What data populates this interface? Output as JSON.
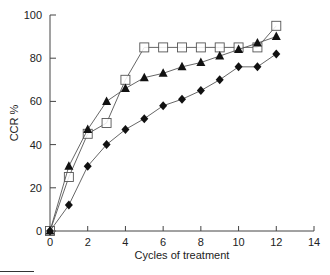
{
  "chart_data": {
    "type": "line",
    "title": "",
    "xlabel": "Cycles  of  treatment",
    "ylabel": "CCR %",
    "xlim": [
      0,
      14
    ],
    "ylim": [
      0,
      100
    ],
    "xticks": [
      0,
      2,
      4,
      6,
      8,
      10,
      12,
      14
    ],
    "yticks": [
      0,
      20,
      40,
      60,
      80,
      100
    ],
    "grid": false,
    "legend": "none",
    "x": [
      0,
      1,
      2,
      3,
      4,
      5,
      6,
      7,
      8,
      9,
      10,
      11,
      12
    ],
    "series": [
      {
        "name": "open-square",
        "marker": "square-open",
        "values": [
          0,
          25,
          45,
          50,
          70,
          85,
          85,
          85,
          85,
          85,
          85,
          85,
          95
        ]
      },
      {
        "name": "filled-triangle",
        "marker": "triangle-filled",
        "values": [
          0,
          30,
          47,
          60,
          66,
          71,
          73,
          76,
          78,
          81,
          84,
          87,
          90
        ]
      },
      {
        "name": "filled-diamond",
        "marker": "diamond-filled",
        "values": [
          0,
          12,
          30,
          40,
          47,
          52,
          58,
          61,
          65,
          70,
          76,
          76,
          82
        ]
      }
    ]
  },
  "axes": {
    "xlabel": "Cycles  of  treatment",
    "ylabel": "CCR %"
  }
}
